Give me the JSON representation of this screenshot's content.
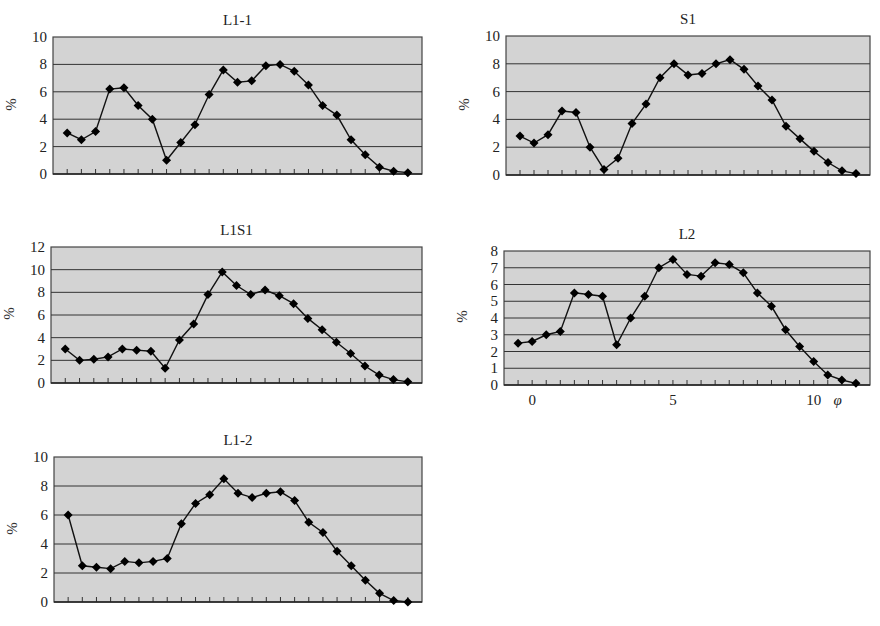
{
  "chart_data": [
    {
      "id": "L1-1",
      "type": "line",
      "title": "L1-1",
      "ylabel": "%",
      "xlabel": "",
      "ylim": [
        0,
        10
      ],
      "yticks": [
        0,
        2,
        4,
        6,
        8,
        10
      ],
      "grid": true,
      "marker": "diamond",
      "values": [
        3.0,
        2.5,
        3.1,
        6.2,
        6.3,
        5.0,
        4.0,
        1.0,
        2.3,
        3.6,
        5.8,
        7.6,
        6.7,
        6.8,
        7.9,
        8.0,
        7.5,
        6.5,
        5.0,
        4.3,
        2.5,
        1.4,
        0.5,
        0.2,
        0.1
      ],
      "box": {
        "left": 53,
        "top": 37,
        "right": 422,
        "bottom": 174
      }
    },
    {
      "id": "S1",
      "type": "line",
      "title": "S1",
      "ylabel": "%",
      "xlabel": "",
      "ylim": [
        0,
        10
      ],
      "yticks": [
        0,
        2,
        4,
        6,
        8,
        10
      ],
      "grid": true,
      "marker": "diamond",
      "values": [
        2.8,
        2.3,
        2.9,
        4.6,
        4.5,
        2.0,
        0.4,
        1.2,
        3.7,
        5.1,
        7.0,
        8.0,
        7.2,
        7.3,
        8.0,
        8.3,
        7.6,
        6.4,
        5.4,
        3.5,
        2.6,
        1.7,
        0.9,
        0.3,
        0.1
      ],
      "box": {
        "left": 506,
        "top": 36,
        "right": 870,
        "bottom": 175
      }
    },
    {
      "id": "L1S1",
      "type": "line",
      "title": "L1S1",
      "ylabel": "%",
      "xlabel": "",
      "ylim": [
        0,
        12
      ],
      "yticks": [
        0,
        2,
        4,
        6,
        8,
        10,
        12
      ],
      "grid": true,
      "marker": "diamond",
      "values": [
        3.0,
        2.0,
        2.1,
        2.3,
        3.0,
        2.9,
        2.8,
        1.3,
        3.8,
        5.2,
        7.8,
        9.8,
        8.6,
        7.8,
        8.2,
        7.7,
        7.0,
        5.7,
        4.7,
        3.6,
        2.6,
        1.5,
        0.7,
        0.3,
        0.1
      ],
      "box": {
        "left": 51,
        "top": 247,
        "right": 422,
        "bottom": 383
      }
    },
    {
      "id": "L2",
      "type": "line",
      "title": "L2",
      "ylabel": "%",
      "xlabel": "φ",
      "ylim": [
        0,
        8
      ],
      "yticks": [
        0,
        1,
        2,
        3,
        4,
        5,
        6,
        7,
        8
      ],
      "xticks": [
        0,
        5,
        10
      ],
      "x": [
        -0.5,
        0,
        0.5,
        1,
        1.5,
        2,
        2.5,
        3,
        3.5,
        4,
        4.5,
        5,
        5.5,
        6,
        6.5,
        7,
        7.5,
        8,
        8.5,
        9,
        9.5,
        10,
        10.5,
        11,
        11.5
      ],
      "grid": true,
      "marker": "diamond",
      "values": [
        2.5,
        2.6,
        3.0,
        3.2,
        5.5,
        5.4,
        5.3,
        2.4,
        4.0,
        5.3,
        7.0,
        7.5,
        6.6,
        6.5,
        7.3,
        7.2,
        6.7,
        5.5,
        4.7,
        3.3,
        2.3,
        1.4,
        0.6,
        0.3,
        0.1
      ],
      "box": {
        "left": 504,
        "top": 251,
        "right": 870,
        "bottom": 385
      }
    },
    {
      "id": "L1-2",
      "type": "line",
      "title": "L1-2",
      "ylabel": "%",
      "xlabel": "",
      "ylim": [
        0,
        10
      ],
      "yticks": [
        0,
        2,
        4,
        6,
        8,
        10
      ],
      "grid": true,
      "marker": "diamond",
      "values": [
        6.0,
        2.5,
        2.4,
        2.3,
        2.8,
        2.7,
        2.8,
        3.0,
        5.4,
        6.8,
        7.4,
        8.5,
        7.5,
        7.2,
        7.5,
        7.6,
        7.0,
        5.5,
        4.8,
        3.5,
        2.5,
        1.5,
        0.6,
        0.1,
        0.0
      ],
      "box": {
        "left": 54,
        "top": 457,
        "right": 422,
        "bottom": 602
      }
    }
  ],
  "style": {
    "plot_bg": "#d3d3d3",
    "grid_color": "#333333",
    "line_color": "#111111",
    "marker_color": "#000000"
  }
}
